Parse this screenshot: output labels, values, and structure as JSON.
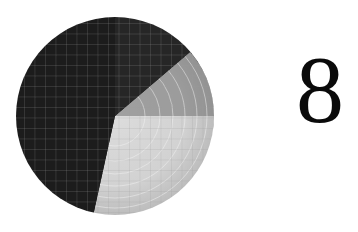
{
  "figure": {
    "numeral": "8",
    "disc": {
      "center": [
        115,
        116
      ],
      "radius": 99,
      "dark_color": "#1c1c1c",
      "light_color": "#e6e6e6",
      "grid_color": "#8a8a8a",
      "grid_spacing": 10.5,
      "wedge_apex": [
        115,
        116
      ],
      "wedge_edge_end": [
        93,
        216
      ],
      "ring_count": 6
    }
  }
}
